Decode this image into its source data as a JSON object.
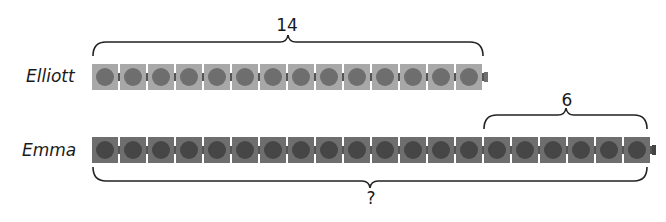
{
  "diagram": {
    "type": "bar-model",
    "rows": [
      {
        "name": "Elliott",
        "cubes": 14,
        "bracket_label": "14"
      },
      {
        "name": "Emma",
        "cubes": 20,
        "part_label": "6",
        "total_label": "?"
      }
    ],
    "colors": {
      "elliott_cube": "#a8a8a8",
      "elliott_dot": "#6e6e6e",
      "emma_cube": "#6e6e6e",
      "emma_dot": "#464646",
      "brace": "#222222"
    }
  },
  "labels": {
    "elliott": "Elliott",
    "emma": "Emma",
    "elliott_total": "14",
    "emma_extra": "6",
    "emma_total": "?"
  }
}
